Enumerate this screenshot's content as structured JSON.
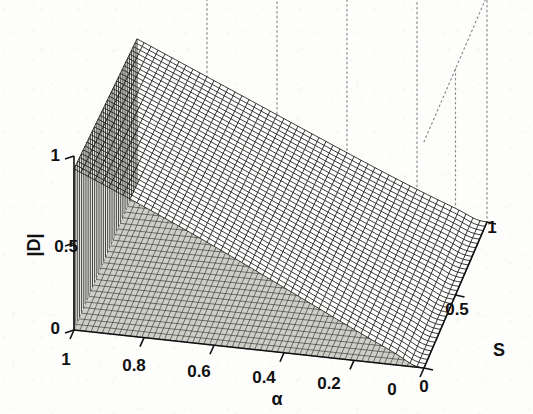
{
  "figure": {
    "kind": "matlab-mesh-3d-surface",
    "background_color": "#fdfdfc",
    "line_color": "#15140f",
    "box_color": "#8d8d8d"
  },
  "axes": {
    "x": {
      "name": "alpha-axis",
      "title": "α",
      "ticks": [
        "1",
        "0.8",
        "0.6",
        "0.4",
        "0.2",
        "0"
      ],
      "tick_values": [
        1,
        0.8,
        0.6,
        0.4,
        0.2,
        0
      ],
      "range": [
        1,
        0
      ],
      "direction": "descending-left-to-right"
    },
    "y": {
      "name": "s-axis",
      "title": "S",
      "ticks": [
        "0",
        "0.5",
        "1"
      ],
      "tick_values": [
        0,
        0.5,
        1
      ],
      "range": [
        0,
        1
      ],
      "direction": "ascending-front-to-back"
    },
    "z": {
      "name": "magnitude-d-axis",
      "title": "|D|",
      "ticks": [
        "0",
        "0.5",
        "1"
      ],
      "tick_values": [
        0,
        0.5,
        1
      ],
      "range": [
        0,
        1
      ]
    }
  },
  "chart_data": {
    "type": "surface",
    "title": "",
    "xlabel": "α",
    "ylabel": "S",
    "zlabel": "|D|",
    "xlim": [
      0,
      1
    ],
    "ylim": [
      0,
      1
    ],
    "zlim": [
      0,
      1
    ],
    "xticks": [
      0,
      0.2,
      0.4,
      0.6,
      0.8,
      1
    ],
    "yticks": [
      0,
      0.5,
      1
    ],
    "zticks": [
      0,
      0.5,
      1
    ],
    "grid": "dotted-box-back-planes",
    "legend": "none",
    "mesh_nx": 48,
    "mesh_ny": 34,
    "surface_note": "z = |D|(alpha, S); plateau height ~1.0 at alpha=1, decaying toward ~0 near alpha=0",
    "z_samples": {
      "alpha_grid": [
        1.0,
        0.8,
        0.6,
        0.4,
        0.2,
        0.0
      ],
      "S_grid": [
        0.0,
        0.25,
        0.5,
        0.75,
        1.0
      ],
      "values": [
        [
          1.0,
          1.0,
          1.0,
          1.0,
          1.0
        ],
        [
          0.97,
          0.96,
          0.95,
          0.94,
          0.93
        ],
        [
          0.93,
          0.91,
          0.89,
          0.87,
          0.85
        ],
        [
          0.87,
          0.84,
          0.81,
          0.78,
          0.75
        ],
        [
          0.78,
          0.73,
          0.68,
          0.63,
          0.58
        ],
        [
          0.6,
          0.45,
          0.28,
          0.12,
          0.0
        ]
      ]
    }
  },
  "annotations": {
    "alpha_tick_1": "1",
    "alpha_tick_08": "0.8",
    "alpha_tick_06": "0.6",
    "alpha_tick_04": "0.4",
    "alpha_tick_02": "0.2",
    "alpha_tick_0": "0",
    "s_tick_0": "0",
    "s_tick_05": "0.5",
    "s_tick_1": "1",
    "z_tick_0": "0",
    "z_tick_05": "0.5",
    "z_tick_1": "1",
    "alpha_title": "α",
    "s_title": "S",
    "z_title": "|D|"
  }
}
